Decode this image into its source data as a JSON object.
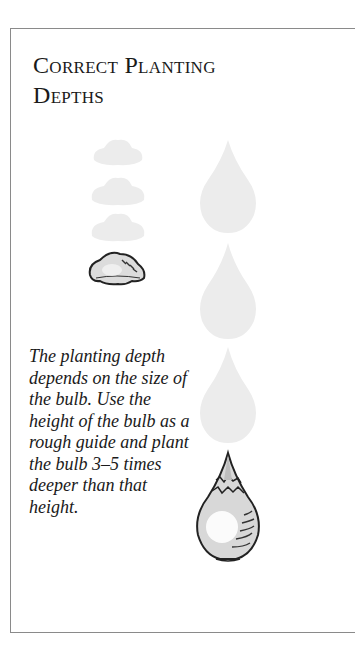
{
  "panel": {
    "title_line1": "Correct Planting",
    "title_line2": "Depths",
    "caption": "The planting depth depends on the size of the bulb. Use the height of the bulb as a rough guide and plant the bulb 3–5 times deeper than that height."
  },
  "figures": {
    "small_bulb": {
      "label": "small-bulb",
      "ghost_count": 3
    },
    "large_bulb": {
      "label": "large-bulb",
      "ghost_count": 3
    }
  },
  "colors": {
    "border": "#8a8a8a",
    "text": "#1a1a1a",
    "ghost": "#ececec",
    "bulb_outline": "#222222",
    "bulb_fill": "#d8d8d8"
  }
}
